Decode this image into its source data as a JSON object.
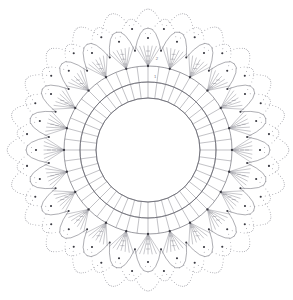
{
  "document": {
    "title": "Crochet Doily Pattern Chart",
    "kind": "crochet-chart-diagram",
    "background_color": "#ffffff",
    "line_color": "#6b6b73",
    "joint_color": "#3a3a42",
    "canvas": {
      "width": 293,
      "height": 300
    }
  },
  "chart_data": {
    "type": "diagram",
    "subtype": "radial-symmetry-stitch-chart",
    "center": {
      "x": 148,
      "y": 150
    },
    "symmetry": {
      "repeats": 24,
      "rotational": true
    },
    "round_labels": [
      "1",
      "2"
    ],
    "rounds": [
      {
        "index": 1,
        "name": "center-ring",
        "stitch": "chain-ring",
        "radius": 52,
        "count": 1,
        "description": "Open foundation ring at the centre of the doily"
      },
      {
        "index": 2,
        "name": "inner-dc-round",
        "stitch": "double-crochet",
        "inner_radius": 52,
        "outer_radius": 68,
        "count": 48,
        "description": "First band of double crochet cells"
      },
      {
        "index": 3,
        "name": "outer-dc-round",
        "stitch": "double-crochet",
        "inner_radius": 68,
        "outer_radius": 84,
        "count": 48,
        "description": "Second band of double crochet cells"
      },
      {
        "index": 4,
        "name": "fan-round",
        "stitch": "fan-shell",
        "inner_radius": 84,
        "outer_radius": 104,
        "count": 24,
        "spokes_per_fan": 7,
        "description": "Fans of long stitches radiating from shared joining points"
      },
      {
        "index": 5,
        "name": "petal-loop-round",
        "stitch": "chain-loop-petal",
        "inner_radius": 100,
        "outer_radius": 122,
        "count": 24,
        "description": "Round of pointed chain petal loops"
      },
      {
        "index": 6,
        "name": "inner-scallop-round",
        "stitch": "chain-arc",
        "inner_radius": 112,
        "outer_radius": 128,
        "count": 24,
        "description": "Chain arcs worked between petal tips"
      },
      {
        "index": 7,
        "name": "outer-scallop-round",
        "stitch": "chain-arc-picot",
        "inner_radius": 122,
        "outer_radius": 136,
        "count": 24,
        "description": "Outermost scalloped chain edging with picot dots"
      }
    ],
    "legend": [
      {
        "symbol": "dot",
        "label": "chain stitch"
      },
      {
        "symbol": "filled-dot",
        "label": "slip stitch / joining point"
      },
      {
        "symbol": "bar",
        "label": "double crochet"
      },
      {
        "symbol": "fan",
        "label": "shell of long stitches"
      }
    ]
  }
}
